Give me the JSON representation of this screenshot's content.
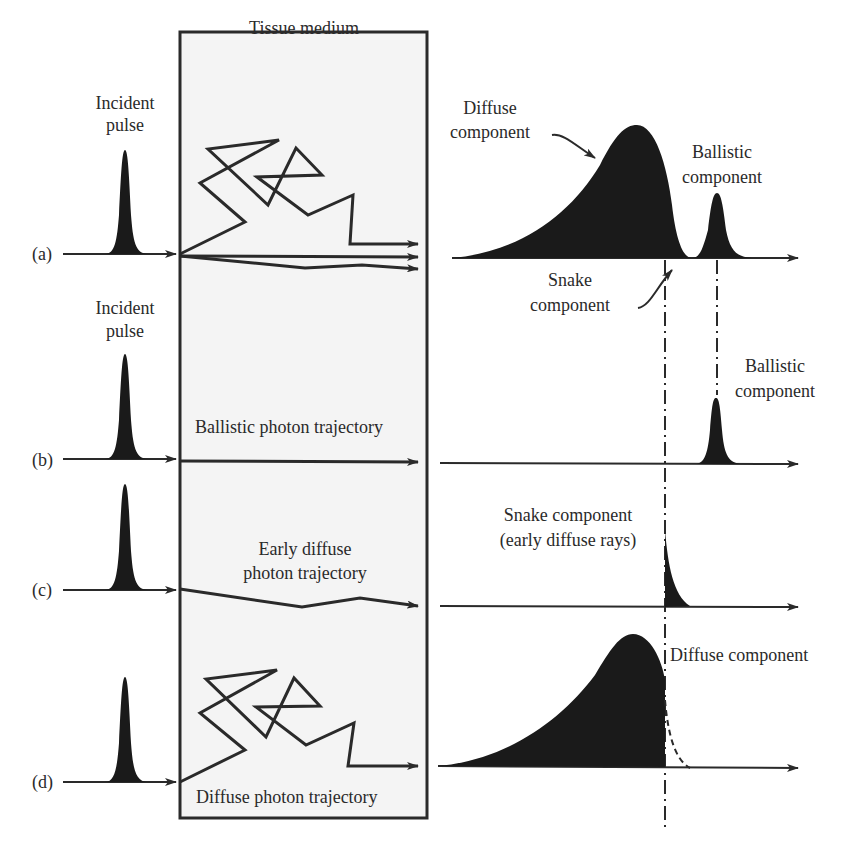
{
  "figure": {
    "tissue_box_label": "Tissue medium",
    "rows": [
      {
        "id": "a",
        "row_label": "(a)",
        "incident_label": [
          "Incident",
          "pulse"
        ],
        "output_labels": {
          "diffuse": [
            "Diffuse",
            "component"
          ],
          "ballistic": [
            "Ballistic",
            "component"
          ],
          "snake": [
            "Snake",
            "component"
          ]
        }
      },
      {
        "id": "b",
        "row_label": "(b)",
        "incident_label": [
          "Incident",
          "pulse"
        ],
        "trajectory_label": "Ballistic photon trajectory",
        "output_labels": {
          "ballistic": [
            "Ballistic",
            "component"
          ]
        }
      },
      {
        "id": "c",
        "row_label": "(c)",
        "trajectory_label": [
          "Early diffuse",
          "photon trajectory"
        ],
        "output_labels": {
          "snake": [
            "Snake component",
            "(early diffuse rays)"
          ]
        }
      },
      {
        "id": "d",
        "row_label": "(d)",
        "trajectory_label": "Diffuse photon trajectory",
        "output_labels": {
          "diffuse": "Diffuse component"
        }
      }
    ],
    "colors": {
      "ink": "#2a2a2a",
      "fill": "#1a1a1a",
      "box_bg": "#f4f4f4"
    }
  }
}
